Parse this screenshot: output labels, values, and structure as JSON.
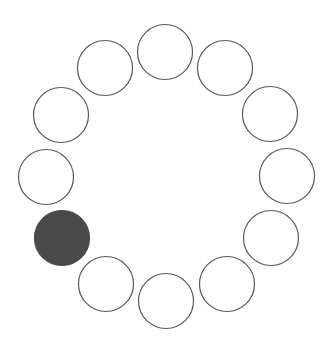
{
  "diagram": {
    "type": "circle-ring",
    "background": "#ffffff",
    "stroke_color": "#5a5a5a",
    "fill_color": "#4a4a4a",
    "radius": 27.5,
    "circles": [
      {
        "cx": 165,
        "cy": 52,
        "filled": false
      },
      {
        "cx": 225,
        "cy": 68,
        "filled": false
      },
      {
        "cx": 270,
        "cy": 114,
        "filled": false
      },
      {
        "cx": 287,
        "cy": 176,
        "filled": false
      },
      {
        "cx": 271,
        "cy": 238,
        "filled": false
      },
      {
        "cx": 227,
        "cy": 284,
        "filled": false
      },
      {
        "cx": 166,
        "cy": 301,
        "filled": false
      },
      {
        "cx": 106,
        "cy": 284,
        "filled": false
      },
      {
        "cx": 62,
        "cy": 238,
        "filled": true
      },
      {
        "cx": 46,
        "cy": 177,
        "filled": false
      },
      {
        "cx": 61,
        "cy": 115,
        "filled": false
      },
      {
        "cx": 105,
        "cy": 68,
        "filled": false
      }
    ]
  }
}
